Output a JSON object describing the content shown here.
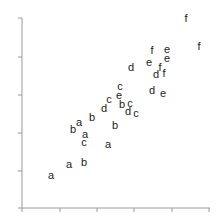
{
  "chart_data": {
    "type": "scatter",
    "title": "",
    "xlabel": "",
    "ylabel": "",
    "marker_style": "text labels (letters a-f as plotting symbols)",
    "xlim": [
      0,
      5
    ],
    "ylim": [
      0,
      5
    ],
    "grid": false,
    "legend": null,
    "x_ticks": [
      0,
      1,
      2,
      3,
      4,
      5
    ],
    "y_ticks": [
      0,
      1,
      2,
      3,
      4,
      5
    ],
    "x_tick_labels_visible": false,
    "y_tick_labels_visible": false,
    "series": [
      {
        "name": "a",
        "points": [
          [
            0.78,
            0.87
          ],
          [
            1.26,
            1.16
          ],
          [
            1.68,
            1.95
          ],
          [
            1.52,
            2.27
          ],
          [
            2.3,
            1.68
          ],
          [
            1.7,
            1.74
          ]
        ]
      },
      {
        "name": "b",
        "points": [
          [
            1.65,
            1.21
          ],
          [
            1.37,
            2.08
          ],
          [
            1.87,
            2.39
          ],
          [
            2.49,
            2.18
          ],
          [
            2.68,
            2.71
          ],
          [
            1.86,
            2.31
          ]
        ]
      },
      {
        "name": "c",
        "points": [
          [
            1.66,
            1.74
          ],
          [
            2.33,
            2.84
          ],
          [
            2.62,
            3.08
          ],
          [
            2.89,
            2.71
          ],
          [
            3.05,
            2.5
          ]
        ]
      },
      {
        "name": "d",
        "points": [
          [
            2.16,
            2.63
          ],
          [
            2.85,
            2.5
          ],
          [
            2.92,
            3.71
          ],
          [
            3.55,
            3.5
          ],
          [
            3.48,
            3.11
          ]
        ]
      },
      {
        "name": "e",
        "points": [
          [
            2.59,
            2.95
          ],
          [
            3.4,
            3.84
          ],
          [
            3.88,
            4.18
          ],
          [
            3.88,
            3.89
          ],
          [
            3.77,
            3.0
          ]
        ]
      },
      {
        "name": "f",
        "points": [
          [
            3.48,
            4.16
          ],
          [
            3.69,
            3.68
          ],
          [
            3.8,
            3.55
          ],
          [
            4.4,
            5.0
          ],
          [
            4.74,
            4.26
          ]
        ]
      }
    ]
  },
  "points": [
    {
      "label": "a",
      "px": 51,
      "py": 175
    },
    {
      "label": "a",
      "px": 69,
      "py": 164
    },
    {
      "label": "b",
      "px": 84,
      "py": 162
    },
    {
      "label": "c",
      "px": 84,
      "py": 142
    },
    {
      "label": "a",
      "px": 85,
      "py": 134
    },
    {
      "label": "b",
      "px": 73,
      "py": 129
    },
    {
      "label": "a",
      "px": 79,
      "py": 122
    },
    {
      "label": "b",
      "px": 92,
      "py": 117
    },
    {
      "label": "a",
      "px": 108,
      "py": 144
    },
    {
      "label": "b",
      "px": 115,
      "py": 125
    },
    {
      "label": "d",
      "px": 104,
      "py": 108
    },
    {
      "label": "c",
      "px": 109,
      "py": 99
    },
    {
      "label": "b",
      "px": 122,
      "py": 104
    },
    {
      "label": "e",
      "px": 119,
      "py": 95
    },
    {
      "label": "c",
      "px": 120,
      "py": 86
    },
    {
      "label": "d",
      "px": 128,
      "py": 111
    },
    {
      "label": "c",
      "px": 130,
      "py": 103
    },
    {
      "label": "c",
      "px": 136,
      "py": 113
    },
    {
      "label": "d",
      "px": 131,
      "py": 67
    },
    {
      "label": "e",
      "px": 149,
      "py": 62
    },
    {
      "label": "f",
      "px": 152,
      "py": 50
    },
    {
      "label": "e",
      "px": 167,
      "py": 49
    },
    {
      "label": "e",
      "px": 167,
      "py": 58
    },
    {
      "label": "d",
      "px": 156,
      "py": 74
    },
    {
      "label": "f",
      "px": 160,
      "py": 67
    },
    {
      "label": "f",
      "px": 164,
      "py": 73
    },
    {
      "label": "d",
      "px": 152,
      "py": 90
    },
    {
      "label": "e",
      "px": 163,
      "py": 93
    },
    {
      "label": "f",
      "px": 186,
      "py": 18
    },
    {
      "label": "f",
      "px": 199,
      "py": 46
    }
  ],
  "axes": {
    "origin": [
      22,
      208
    ],
    "x_end": 210,
    "y_end": 18,
    "x_tick_px": [
      22,
      60,
      97,
      134,
      172,
      209
    ],
    "y_tick_px": [
      208,
      171,
      133,
      95,
      57,
      18
    ],
    "color": "#9a9a9a"
  }
}
